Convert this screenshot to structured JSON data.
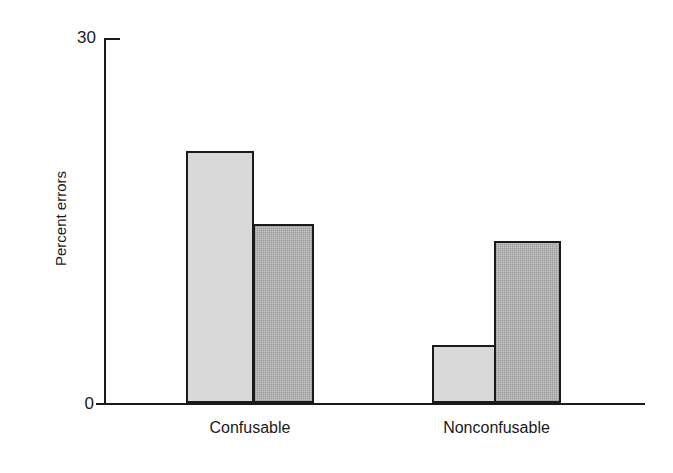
{
  "chart_data": {
    "type": "bar",
    "title": "",
    "xlabel": "",
    "ylabel": "Percent errors",
    "categories": [
      "Confusable",
      "Nonconfusable"
    ],
    "ylim": [
      0,
      30
    ],
    "ytick_labels": [
      "0",
      "30"
    ],
    "yticks": [
      0,
      30
    ],
    "grid": false,
    "legend": "none",
    "series": [
      {
        "name": "light-gray-bar",
        "fill": "#d9d9d9",
        "values": [
          20.7,
          4.8
        ]
      },
      {
        "name": "dark-gray-bar",
        "fill": "#c6c6c6",
        "values": [
          14.7,
          13.3
        ]
      }
    ],
    "bars": [
      {
        "group": "Confusable",
        "series": "light-gray-bar",
        "value": 20.7
      },
      {
        "group": "Confusable",
        "series": "dark-gray-bar",
        "value": 14.7
      },
      {
        "group": "Nonconfusable",
        "series": "light-gray-bar",
        "value": 4.8
      },
      {
        "group": "Nonconfusable",
        "series": "dark-gray-bar",
        "value": 13.3
      }
    ]
  },
  "axis": {
    "y_title": "Percent errors",
    "y_max_label": "30",
    "y_min_label": "0"
  },
  "categories": {
    "first": "Confusable",
    "second": "Nonconfusable"
  },
  "colors": {
    "axis": "#1a1a1a",
    "bar_light": "#d9d9d9",
    "bar_dark": "#c6c6c6",
    "background": "#ffffff"
  }
}
